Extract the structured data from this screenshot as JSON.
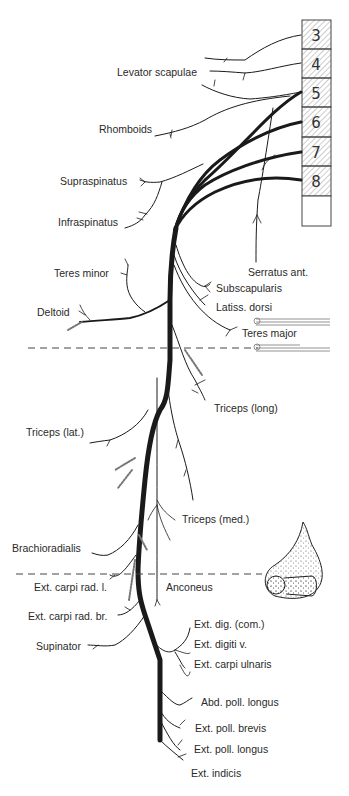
{
  "diagram": {
    "spinal_segments": [
      "3",
      "4",
      "5",
      "6",
      "7",
      "8",
      ""
    ],
    "labels": {
      "levator_scapulae": "Levator scapulae",
      "rhomboids": "Rhomboids",
      "supraspinatus": "Supraspinatus",
      "infraspinatus": "Infraspinatus",
      "serratus_ant": "Serratus ant.",
      "teres_minor": "Teres minor",
      "subscapularis": "Subscapularis",
      "deltoid": "Deltoid",
      "latiss_dorsi": "Latiss. dorsi",
      "teres_major": "Teres major",
      "triceps_long": "Triceps (long)",
      "triceps_lat": "Triceps (lat.)",
      "triceps_med": "Triceps (med.)",
      "brachioradialis": "Brachioradialis",
      "ext_carpi_rad_l": "Ext. carpi rad. l.",
      "anconeus": "Anconeus",
      "ext_carpi_rad_br": "Ext. carpi rad. br.",
      "ext_dig_com": "Ext. dig. (com.)",
      "supinator": "Supinator",
      "ext_digiti_v": "Ext. digiti v.",
      "ext_carpi_ulnaris": "Ext. carpi ulnaris",
      "abd_poll_longus": "Abd. poll. longus",
      "ext_poll_brevis": "Ext. poll. brevis",
      "ext_poll_longus": "Ext. poll. longus",
      "ext_indicis": "Ext. indicis"
    },
    "colors": {
      "ink": "#1a1a1a",
      "hatch": "#8a8a8a",
      "stipple": "#6a6a6a"
    }
  }
}
